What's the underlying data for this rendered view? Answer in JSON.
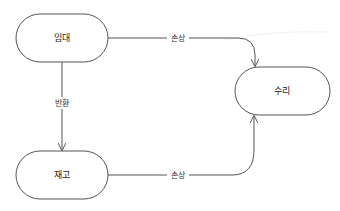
{
  "diagram": {
    "type": "state-flow",
    "nodes": [
      {
        "id": "rental",
        "label": "임대"
      },
      {
        "id": "repair",
        "label": "수리"
      },
      {
        "id": "inventory",
        "label": "재고"
      }
    ],
    "edges": [
      {
        "from": "rental",
        "to": "repair",
        "label": "손상"
      },
      {
        "from": "rental",
        "to": "inventory",
        "label": "반환"
      },
      {
        "from": "inventory",
        "to": "repair",
        "label": "손상"
      }
    ],
    "colors": {
      "stroke": "#555555",
      "text": "#222222",
      "background": "#ffffff"
    }
  }
}
